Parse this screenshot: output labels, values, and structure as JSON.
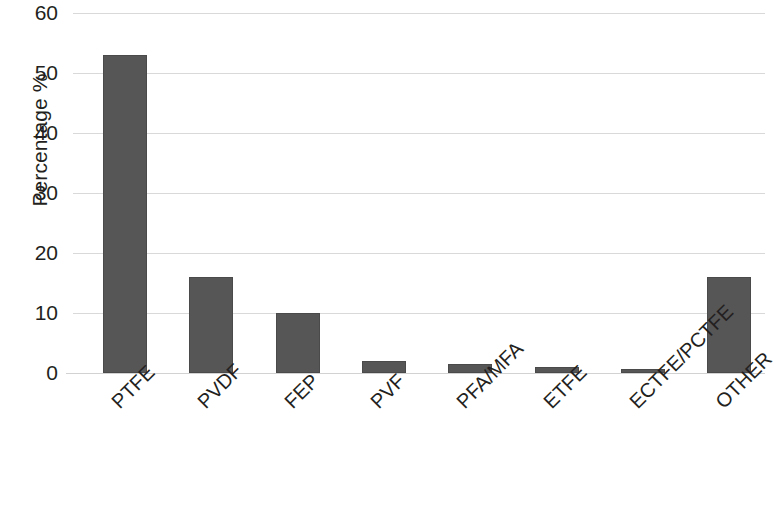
{
  "chart_data": {
    "type": "bar",
    "title": "",
    "subtitle": "",
    "xlabel": "",
    "ylabel": "Percentage %",
    "categories": [
      "PTFE",
      "PVDF",
      "FEP",
      "PVF",
      "PFA/MFA",
      "ETFE",
      "ECTFE/PCTFE",
      "OTHER"
    ],
    "values": [
      53,
      16,
      10,
      2,
      1.5,
      1,
      0.5,
      16
    ],
    "ylim": [
      0,
      60
    ],
    "ytick_labels": [
      "60",
      "50",
      "40",
      "30",
      "20",
      "10",
      "0"
    ],
    "ytick_values": [
      60,
      50,
      40,
      30,
      20,
      10,
      0
    ],
    "grid": true,
    "legend": false,
    "legend_position": "none",
    "bar_color": "#565656",
    "grid_color": "#d9d9d9",
    "text_color": "#231f20",
    "background_color": "#ffffff",
    "xtick_label_rotation_degrees": -45
  }
}
